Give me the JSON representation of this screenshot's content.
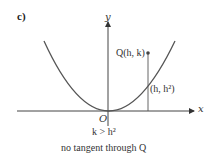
{
  "panel": {
    "label": "c)"
  },
  "axes": {
    "x_label": "x",
    "y_label": "y",
    "origin_label": "O"
  },
  "curve": {
    "equation": "y = x^2",
    "color": "#555555"
  },
  "points": {
    "Q": {
      "label": "Q(h, k)"
    },
    "on_curve": {
      "label": "(h, h²)"
    }
  },
  "condition": "k > h²",
  "caption": "no tangent through Q",
  "colors": {
    "ink": "#333333",
    "axis": "#444444"
  }
}
